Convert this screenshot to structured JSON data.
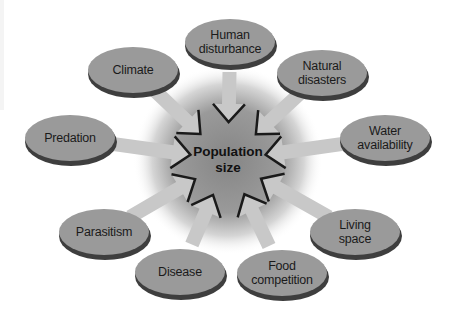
{
  "diagram": {
    "type": "radial-influence-diagram",
    "center": {
      "label": "Population\nsize",
      "x": 228,
      "y": 160
    },
    "colors": {
      "ellipse_fill": "#9a9a9a",
      "ellipse_shadow": "#3e3e3e",
      "arrow_fill": "#c8c8c8",
      "arrow_edge": "#1a1a1a",
      "halo_center": "#8c8c8c",
      "background": "#ffffff"
    },
    "factors": [
      {
        "id": "human-disturbance",
        "label": "Human\ndisturbance",
        "x": 230,
        "y": 42
      },
      {
        "id": "climate",
        "label": "Climate",
        "x": 133,
        "y": 70
      },
      {
        "id": "natural-disasters",
        "label": "Natural\ndisasters",
        "x": 322,
        "y": 73
      },
      {
        "id": "predation",
        "label": "Predation",
        "x": 70,
        "y": 138
      },
      {
        "id": "water-availability",
        "label": "Water\navailability",
        "x": 385,
        "y": 138
      },
      {
        "id": "parasitism",
        "label": "Parasitism",
        "x": 104,
        "y": 232
      },
      {
        "id": "living-space",
        "label": "Living\nspace",
        "x": 355,
        "y": 232
      },
      {
        "id": "disease",
        "label": "Disease",
        "x": 180,
        "y": 272
      },
      {
        "id": "food-competition",
        "label": "Food\ncompetition",
        "x": 282,
        "y": 273
      }
    ]
  }
}
